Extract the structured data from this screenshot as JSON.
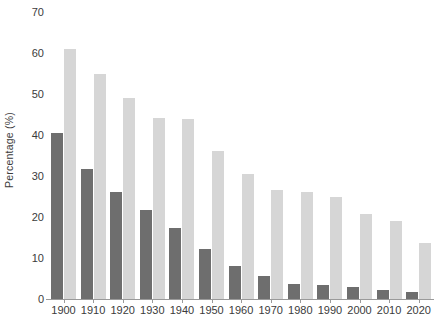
{
  "chart_data": {
    "type": "bar",
    "title": "",
    "subtitle": "",
    "xlabel": "",
    "ylabel": "Percentage (%)",
    "categories": [
      "1900",
      "1910",
      "1920",
      "1930",
      "1940",
      "1950",
      "1960",
      "1970",
      "1980",
      "1990",
      "2000",
      "2010",
      "2020"
    ],
    "series": [
      {
        "name": "dark-series",
        "color": "#6e6e6e",
        "values": [
          40.5,
          31.8,
          26.2,
          21.6,
          17.2,
          12.1,
          8.1,
          5.5,
          3.7,
          3.3,
          2.9,
          2.2,
          1.7
        ]
      },
      {
        "name": "light-series",
        "color": "#d6d6d6",
        "values": [
          61.0,
          54.8,
          49.0,
          44.1,
          43.8,
          36.1,
          30.5,
          26.6,
          26.2,
          24.8,
          20.8,
          19.0,
          13.7
        ]
      }
    ],
    "ylim": [
      0,
      70
    ],
    "yticks": [
      0,
      10,
      20,
      30,
      40,
      50,
      60,
      70
    ],
    "ytick_labels": [
      "0",
      "10",
      "20",
      "30",
      "40",
      "50",
      "60",
      "70"
    ],
    "grid": false,
    "legend": "none",
    "axis_color": "#9a9a9a",
    "text_color": "#3b3b3b",
    "background": "#ffffff"
  }
}
